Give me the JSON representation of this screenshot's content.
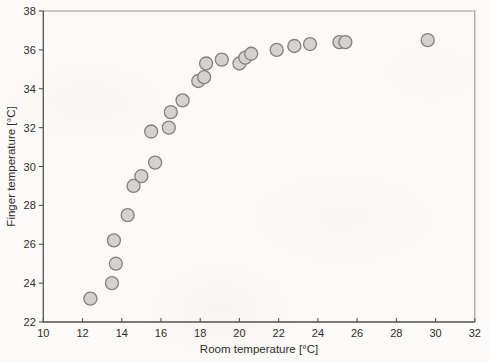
{
  "figure": {
    "width": 489,
    "height": 363,
    "background_color": "#fbfaf8"
  },
  "chart_data": {
    "type": "scatter",
    "title": "",
    "xlabel": "Room temperature [°C]",
    "ylabel": "Finger temperature [°C]",
    "xlim": [
      10,
      32
    ],
    "ylim": [
      22,
      38
    ],
    "x_ticks": [
      10,
      12,
      14,
      16,
      18,
      20,
      22,
      24,
      26,
      28,
      30,
      32
    ],
    "y_ticks": [
      22,
      24,
      26,
      28,
      30,
      32,
      34,
      36,
      38
    ],
    "grid": false,
    "legend": null,
    "points": [
      [
        12.4,
        23.2
      ],
      [
        13.5,
        24.0
      ],
      [
        13.7,
        25.0
      ],
      [
        13.6,
        26.2
      ],
      [
        14.3,
        27.5
      ],
      [
        14.6,
        29.0
      ],
      [
        15.0,
        29.5
      ],
      [
        15.7,
        30.2
      ],
      [
        15.5,
        31.8
      ],
      [
        16.4,
        32.0
      ],
      [
        16.5,
        32.8
      ],
      [
        17.1,
        33.4
      ],
      [
        17.9,
        34.4
      ],
      [
        18.2,
        34.6
      ],
      [
        18.3,
        35.3
      ],
      [
        19.1,
        35.5
      ],
      [
        20.0,
        35.3
      ],
      [
        20.3,
        35.6
      ],
      [
        20.6,
        35.8
      ],
      [
        21.9,
        36.0
      ],
      [
        22.8,
        36.2
      ],
      [
        23.6,
        36.3
      ],
      [
        25.1,
        36.4
      ],
      [
        25.4,
        36.4
      ],
      [
        29.6,
        36.5
      ]
    ],
    "marker": {
      "shape": "circle",
      "radius_px": 6.5,
      "fill": "#d3d2cf",
      "stroke": "#84817d",
      "stroke_width": 1.3
    },
    "axis_color": "#55524f",
    "box_color": "#969390",
    "text_color": "#2f2d2b"
  }
}
